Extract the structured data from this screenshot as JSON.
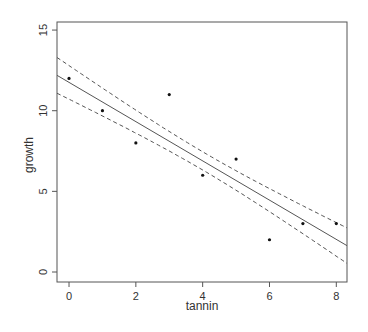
{
  "chart_data": {
    "type": "scatter",
    "title": "",
    "xlabel": "tannin",
    "ylabel": "growth",
    "xlim": [
      -0.36,
      8.32
    ],
    "ylim": [
      -0.62,
      15.5
    ],
    "x_ticks": [
      0,
      2,
      4,
      6,
      8
    ],
    "x_tick_labels": [
      "0",
      "2",
      "4",
      "6",
      "8"
    ],
    "y_ticks": [
      0,
      5,
      10,
      15
    ],
    "y_tick_labels": [
      "0",
      "5",
      "10",
      "15"
    ],
    "grid": false,
    "legend": null,
    "points": {
      "x": [
        0,
        1,
        2,
        3,
        4,
        5,
        6,
        7,
        8
      ],
      "y": [
        12,
        10,
        8,
        11,
        6,
        7,
        2,
        3,
        3
      ]
    },
    "fit_line": {
      "style": "solid",
      "intercept": 11.756,
      "slope": -1.2167
    },
    "confidence_bands": {
      "style": "dashed",
      "description": "fitted value ± 1 standard error of the mean prediction",
      "residual_sd": 1.693,
      "n": 9,
      "x_mean": 4,
      "sxx": 60
    },
    "colors": {
      "points": "#111111",
      "line": "#555555",
      "axes": "#555555",
      "text": "#333333"
    }
  }
}
